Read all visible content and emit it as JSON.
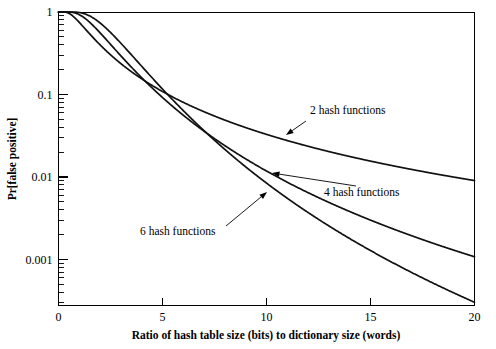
{
  "chart_data": {
    "type": "line",
    "title": "",
    "xlabel": "Ratio of hash table size (bits) to dictionary size (words)",
    "ylabel": "Pr[false positive]",
    "xlim": [
      0,
      20
    ],
    "ylim": [
      0.00028,
      1
    ],
    "yscale": "log",
    "xscale": "linear",
    "grid": false,
    "legend": "inline-annotations",
    "xticks": [
      0,
      5,
      10,
      15,
      20
    ],
    "xticklabels": [
      "0",
      "5",
      "10",
      "15",
      "20"
    ],
    "yticks": [
      1,
      0.1,
      0.01,
      0.001
    ],
    "yticklabels": [
      "1",
      "0.1",
      "0.01",
      "0.001"
    ],
    "series": [
      {
        "name": "2 hash functions",
        "k": 2,
        "annotation": "2 hash functions",
        "x": [
          0,
          1,
          2,
          3,
          4,
          5,
          6,
          7,
          8,
          9,
          10,
          11,
          12,
          13,
          14,
          15,
          16,
          17,
          18,
          19,
          20
        ],
        "y": [
          1.0,
          0.7996,
          0.6219,
          0.4861,
          0.3868,
          0.313,
          0.2573,
          0.2144,
          0.1809,
          0.1543,
          0.1328,
          0.1153,
          0.1009,
          0.0889,
          0.0788,
          0.0703,
          0.063,
          0.0568,
          0.0514,
          0.0467,
          0.0426
        ]
      },
      {
        "name": "4 hash functions",
        "k": 4,
        "annotation": "4 hash functions",
        "x": [
          0,
          1,
          2,
          3,
          4,
          5,
          6,
          7,
          8,
          9,
          10,
          11,
          12,
          13,
          14,
          15,
          16,
          17,
          18,
          19,
          20
        ],
        "y": [
          1.0,
          0.9997,
          0.9528,
          0.7843,
          0.5921,
          0.4387,
          0.3252,
          0.2434,
          0.1846,
          0.1421,
          0.1109,
          0.0876,
          0.07,
          0.0566,
          0.0462,
          0.0381,
          0.0317,
          0.0266,
          0.0225,
          0.0191,
          0.0164
        ]
      },
      {
        "name": "6 hash functions",
        "k": 6,
        "annotation": "6 hash functions",
        "x": [
          0,
          1,
          2,
          3,
          4,
          5,
          6,
          7,
          8,
          9,
          10,
          11,
          12,
          13,
          14,
          15,
          16,
          17,
          18,
          19,
          20
        ],
        "y": [
          1.0,
          1.0,
          0.9988,
          0.9481,
          0.7806,
          0.5815,
          0.4137,
          0.2893,
          0.2018,
          0.1417,
          0.1003,
          0.0718,
          0.052,
          0.0381,
          0.0282,
          0.0211,
          0.016,
          0.0122,
          0.0094,
          0.0073,
          0.0058
        ]
      }
    ],
    "annotations": [
      {
        "text": "2 hash functions",
        "text_x": 310,
        "text_y": 114,
        "arrow_from_x": 306,
        "arrow_from_y": 121,
        "arrow_to_x": 286,
        "arrow_to_y": 135
      },
      {
        "text": "4 hash functions",
        "text_x": 324,
        "text_y": 196,
        "arrow_from_x": 356,
        "arrow_from_y": 186,
        "arrow_to_x": 272,
        "arrow_to_y": 173
      },
      {
        "text": "6 hash functions",
        "text_x": 140,
        "text_y": 235,
        "arrow_from_x": 226,
        "arrow_from_y": 226,
        "arrow_to_x": 267,
        "arrow_to_y": 192
      }
    ]
  }
}
